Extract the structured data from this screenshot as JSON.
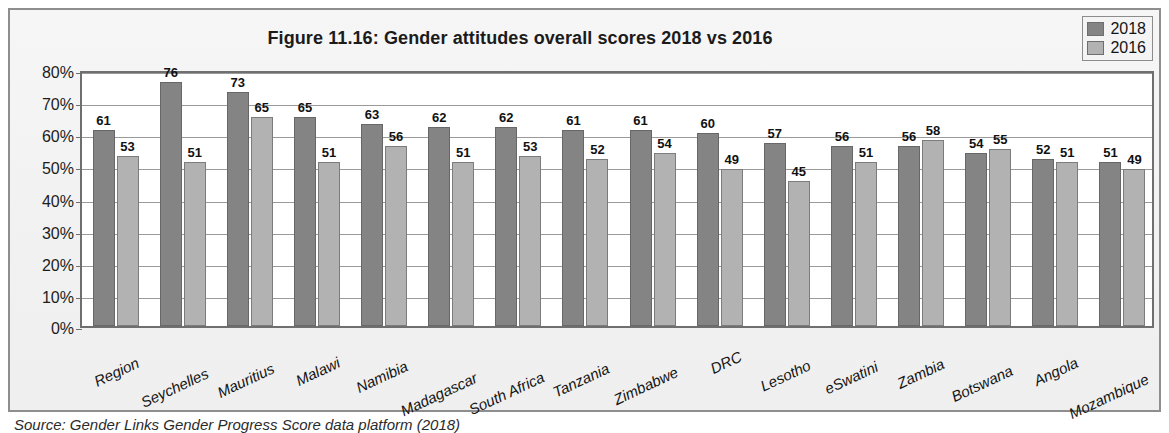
{
  "figure": {
    "title": "Figure 11.16: Gender attitudes overall scores 2018 vs 2016",
    "source": "Source: Gender Links Gender Progress Score data platform (2018)"
  },
  "legend": {
    "position": "top-right",
    "entries": [
      {
        "label": "2018",
        "color": "#848484"
      },
      {
        "label": "2016",
        "color": "#b2b2b2"
      }
    ]
  },
  "axis": {
    "y_ticks": [
      "0%",
      "10%",
      "20%",
      "30%",
      "40%",
      "50%",
      "60%",
      "70%",
      "80%"
    ]
  },
  "chart_data": {
    "type": "bar",
    "title": "Figure 11.16: Gender attitudes overall scores 2018 vs 2016",
    "xlabel": "",
    "ylabel": "",
    "ylim": [
      0,
      80
    ],
    "ytick_step": 10,
    "ytick_format": "percent",
    "grid": true,
    "legend_position": "top-right",
    "categories": [
      "Region",
      "Seychelles",
      "Mauritius",
      "Malawi",
      "Namibia",
      "Madagascar",
      "South Africa",
      "Tanzania",
      "Zimbabwe",
      "DRC",
      "Lesotho",
      "eSwatini",
      "Zambia",
      "Botswana",
      "Angola",
      "Mozambique"
    ],
    "series": [
      {
        "name": "2018",
        "color": "#848484",
        "values": [
          61,
          76,
          73,
          65,
          63,
          62,
          62,
          61,
          61,
          60,
          57,
          56,
          56,
          54,
          52,
          51
        ]
      },
      {
        "name": "2016",
        "color": "#b2b2b2",
        "values": [
          53,
          51,
          65,
          51,
          56,
          51,
          53,
          52,
          54,
          49,
          45,
          51,
          58,
          55,
          51,
          49
        ]
      }
    ]
  }
}
